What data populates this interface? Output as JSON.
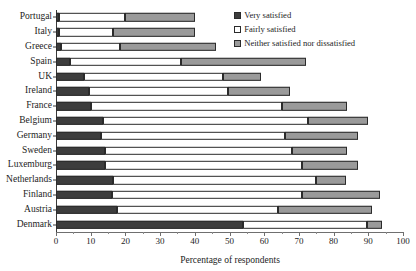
{
  "chart_data": {
    "type": "bar",
    "orientation": "horizontal",
    "stacked": true,
    "title": "",
    "xlabel": "Percentage of respondents",
    "ylabel": "",
    "xlim": [
      0,
      100
    ],
    "xticks": [
      0,
      10,
      20,
      30,
      40,
      50,
      60,
      70,
      80,
      90,
      100
    ],
    "grid": false,
    "legend_position": "top-right",
    "categories": [
      "Portugal",
      "Italy",
      "Greece",
      "Spain",
      "UK",
      "Ireland",
      "France",
      "Belgium",
      "Germany",
      "Sweden",
      "Luxemburg",
      "Netherlands",
      "Finland",
      "Austria",
      "Denmark"
    ],
    "series": [
      {
        "name": "Very satisfied",
        "color": "#3d3d3d",
        "values": [
          1,
          1,
          1.5,
          4,
          8,
          9.5,
          10,
          13.5,
          13,
          14,
          14,
          16.5,
          16,
          17.5,
          54
        ]
      },
      {
        "name": "Fairly satisfied",
        "color": "#ffffff",
        "values": [
          19,
          15.5,
          17,
          32,
          40,
          40,
          55,
          59,
          53,
          54,
          57,
          58.5,
          55,
          46.5,
          35.5
        ]
      },
      {
        "name": "Neither satisfied nor dissatisfied",
        "color": "#9a9a9a",
        "values": [
          20,
          23.5,
          27.5,
          36,
          11,
          18,
          19,
          17.5,
          21,
          16,
          16,
          8.5,
          22.5,
          27,
          4.5
        ]
      }
    ],
    "totals": [
      40,
      40,
      46,
      72,
      59,
      67.5,
      84,
      90,
      87,
      84,
      87,
      83.5,
      93.5,
      91,
      94
    ]
  },
  "legend": {
    "items": [
      {
        "label": "Very satisfied",
        "key": "very"
      },
      {
        "label": "Fairly satisfied",
        "key": "fairly"
      },
      {
        "label": "Neither satisfied nor dissatisfied",
        "key": "neither"
      }
    ]
  }
}
